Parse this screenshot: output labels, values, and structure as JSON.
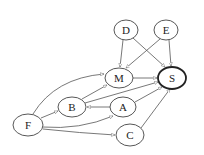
{
  "diagram": {
    "type": "directed-graph",
    "nodes": [
      {
        "id": "D",
        "label": "D",
        "cx": 126,
        "cy": 30,
        "rx": 12,
        "ry": 10,
        "bold": false
      },
      {
        "id": "E",
        "label": "E",
        "cx": 166,
        "cy": 30,
        "rx": 12,
        "ry": 10,
        "bold": false
      },
      {
        "id": "M",
        "label": "M",
        "cx": 119,
        "cy": 78,
        "rx": 14,
        "ry": 10,
        "bold": false
      },
      {
        "id": "S",
        "label": "S",
        "cx": 172,
        "cy": 78,
        "rx": 14,
        "ry": 11,
        "bold": true
      },
      {
        "id": "B",
        "label": "B",
        "cx": 72,
        "cy": 107,
        "rx": 14,
        "ry": 10,
        "bold": false
      },
      {
        "id": "A",
        "label": "A",
        "cx": 123,
        "cy": 107,
        "rx": 13,
        "ry": 10,
        "bold": false
      },
      {
        "id": "F",
        "label": "F",
        "cx": 28,
        "cy": 125,
        "rx": 15,
        "ry": 11,
        "bold": false
      },
      {
        "id": "C",
        "label": "C",
        "cx": 130,
        "cy": 135,
        "rx": 14,
        "ry": 11,
        "bold": false
      }
    ],
    "edges": [
      {
        "from": "D",
        "to": "M"
      },
      {
        "from": "D",
        "to": "S"
      },
      {
        "from": "E",
        "to": "M"
      },
      {
        "from": "E",
        "to": "S"
      },
      {
        "from": "M",
        "to": "S"
      },
      {
        "from": "B",
        "to": "M"
      },
      {
        "from": "B",
        "to": "S"
      },
      {
        "from": "A",
        "to": "B"
      },
      {
        "from": "A",
        "to": "S"
      },
      {
        "from": "C",
        "to": "S"
      },
      {
        "from": "F",
        "to": "M",
        "curved": true
      },
      {
        "from": "F",
        "to": "B"
      },
      {
        "from": "F",
        "to": "A",
        "curved": true
      },
      {
        "from": "F",
        "to": "C"
      }
    ]
  }
}
